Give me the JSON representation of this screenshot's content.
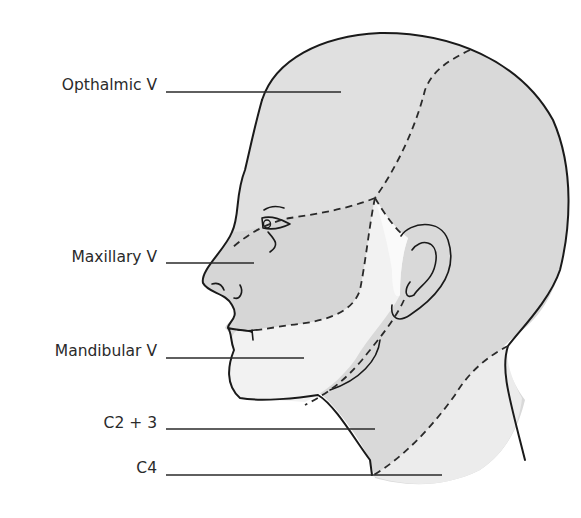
{
  "diagram": {
    "labels": [
      {
        "id": "opthalmic",
        "text": "Opthalmic V"
      },
      {
        "id": "maxillary",
        "text": "Maxillary V"
      },
      {
        "id": "mandibular",
        "text": "Mandibular V"
      },
      {
        "id": "c2_3",
        "text": "C2 + 3"
      },
      {
        "id": "c4",
        "text": "C4"
      }
    ],
    "colors": {
      "background": "#ffffff",
      "scalp_and_c2_3": "#d9d9d9",
      "opthalmic": "#e0e0e0",
      "maxillary": "#d6d6d6",
      "mandibular": "#f2f2f2",
      "c4": "#ececec",
      "ear_gap": "#fafafa",
      "line": "#1a1a1a"
    }
  }
}
